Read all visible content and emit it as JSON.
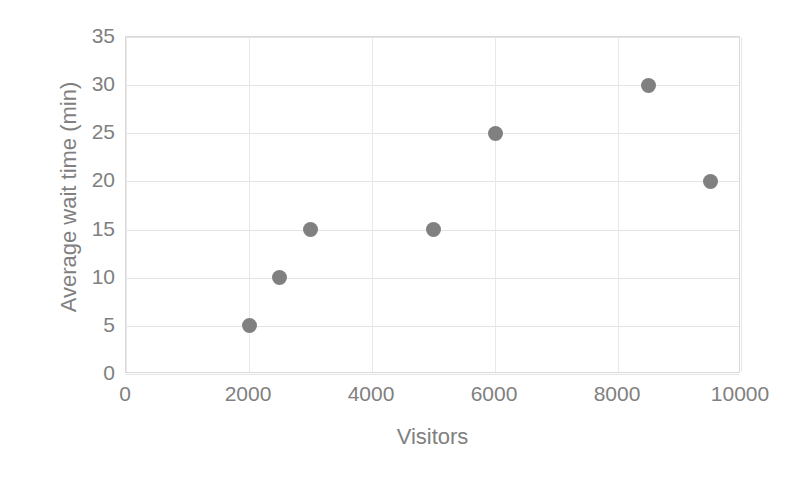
{
  "chart_data": {
    "type": "scatter",
    "title": "",
    "xlabel": "Visitors",
    "ylabel": "Average wait time (min)",
    "xlim": [
      0,
      10000
    ],
    "ylim": [
      0,
      35
    ],
    "xticks": [
      0,
      2000,
      4000,
      6000,
      8000,
      10000
    ],
    "yticks": [
      0,
      5,
      10,
      15,
      20,
      25,
      30,
      35
    ],
    "xtick_labels": [
      "0",
      "2000",
      "4000",
      "6000",
      "8000",
      "10000"
    ],
    "ytick_labels": [
      "0",
      "5",
      "10",
      "15",
      "20",
      "25",
      "30",
      "35"
    ],
    "grid": true,
    "legend": false,
    "marker_color": "#808080",
    "axis_text_color": "#808080",
    "gridline_color": "#e4e4e4",
    "plot_border_color": "#d9d9d9",
    "background_color": "#ffffff",
    "points": [
      {
        "x": 2000,
        "y": 5
      },
      {
        "x": 2500,
        "y": 10
      },
      {
        "x": 3000,
        "y": 15
      },
      {
        "x": 5000,
        "y": 15
      },
      {
        "x": 6000,
        "y": 25
      },
      {
        "x": 8500,
        "y": 30
      },
      {
        "x": 9500,
        "y": 20
      }
    ]
  }
}
